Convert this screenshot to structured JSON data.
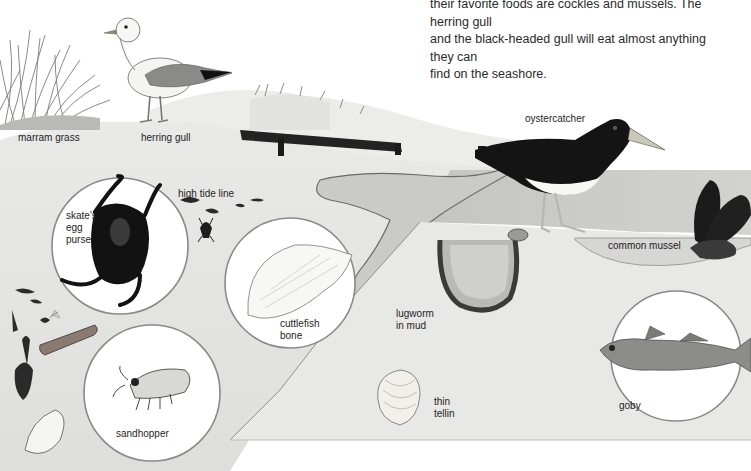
{
  "intro_text": {
    "line1": "their favorite foods are cockles and mussels. The herring gull",
    "line2": "and the black-headed gull will eat almost anything they can",
    "line3": "find on the seashore."
  },
  "labels": {
    "marram_grass": "marram grass",
    "herring_gull": "herring gull",
    "high_tide_line": "high tide line",
    "oystercatcher": "oystercatcher",
    "common_mussel": "common mussel",
    "skates_egg_purse": [
      "skate's",
      "egg",
      "purse"
    ],
    "cuttlefish_bone": [
      "cuttlefish",
      "bone"
    ],
    "lugworm": [
      "lugworm",
      "in mud"
    ],
    "thin_tellin": [
      "thin",
      "tellin"
    ],
    "sandhopper": "sandhopper",
    "goby": "goby"
  },
  "colors": {
    "sand": "#e4e4e2",
    "sand_dark": "#cfcfcc",
    "water": "#c9c9c7",
    "mud": "#dcdcda",
    "ink": "#1e1e1e",
    "circle_border": "#9a9a9a"
  }
}
